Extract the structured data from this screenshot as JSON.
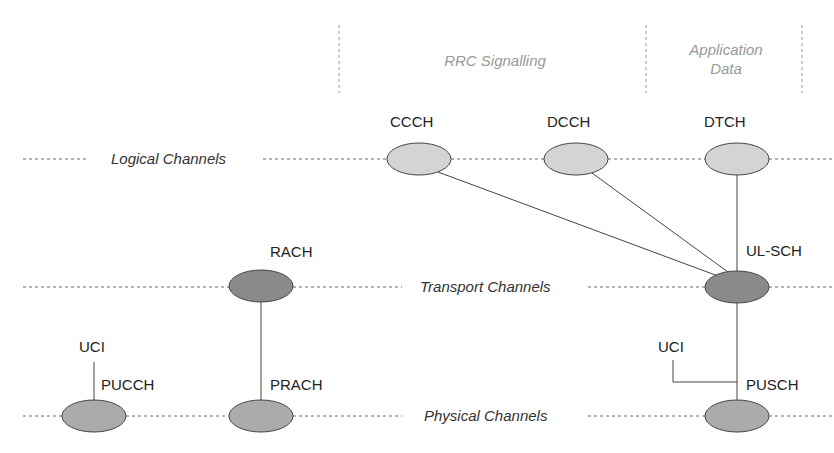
{
  "header": {
    "rrc_signalling": "RRC Signalling",
    "application_data_line1": "Application",
    "application_data_line2": "Data"
  },
  "layers": {
    "logical": "Logical Channels",
    "transport": "Transport Channels",
    "physical": "Physical Channels"
  },
  "channels": {
    "ccch": "CCCH",
    "dcch": "DCCH",
    "dtch": "DTCH",
    "rach": "RACH",
    "ulsch": "UL-SCH",
    "pucch": "PUCCH",
    "prach": "PRACH",
    "pusch": "PUSCH",
    "uci_left": "UCI",
    "uci_right": "UCI"
  },
  "colors": {
    "logical_fill": "#d4d4d4",
    "transport_fill": "#8a8a8a",
    "physical_fill": "#ababab",
    "stroke": "#444444",
    "dash": "#666666"
  }
}
